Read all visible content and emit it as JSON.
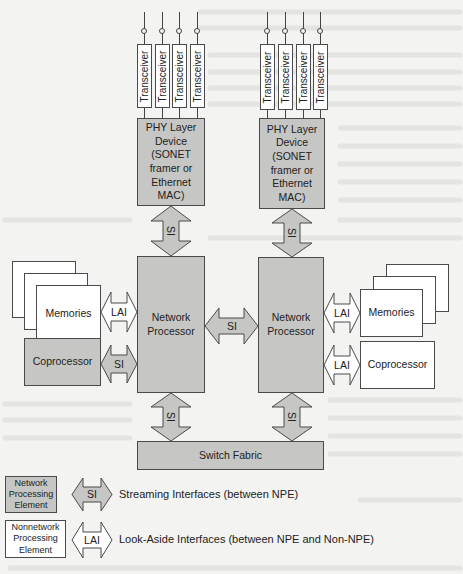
{
  "diagram": {
    "colors": {
      "background": "#f3f3f1",
      "npe_fill": "#c6c6c4",
      "non_npe_fill": "#ffffff",
      "stroke": "#4a4a4a"
    },
    "transceiver_label": "Transceiver",
    "phy_left": {
      "lines": [
        "PHY Layer",
        "Device",
        "(SONET",
        "framer or",
        "Ethernet",
        "MAC)"
      ]
    },
    "phy_right": {
      "lines": [
        "PHY Layer",
        "Device",
        "(SONET",
        "framer or",
        "Ethernet",
        "MAC)"
      ]
    },
    "np_left": {
      "lines": [
        "Network",
        "Processor"
      ]
    },
    "np_right": {
      "lines": [
        "Network",
        "Processor"
      ]
    },
    "memories_left": "Memories",
    "memories_right": "Memories",
    "coprocessor_left": "Coprocessor",
    "coprocessor_right": "Coprocessor",
    "switch_fabric": "Switch Fabric",
    "interfaces": {
      "si": "SI",
      "lai": "LAI"
    },
    "legend": {
      "npe": {
        "lines": [
          "Network",
          "Processing",
          "Element"
        ]
      },
      "non_npe": {
        "lines": [
          "Nonnetwork",
          "Processing",
          "Element"
        ]
      },
      "si_label": "SI",
      "si_desc": "Streaming Interfaces (between NPE)",
      "lai_label": "LAI",
      "lai_desc": "Look-Aside Interfaces (between NPE and Non-NPE)"
    }
  }
}
